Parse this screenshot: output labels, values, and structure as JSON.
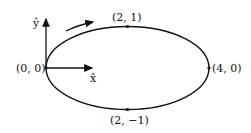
{
  "diagram": {
    "points": {
      "origin": "(0, 0)",
      "top": "(2, 1)",
      "right": "(4, 0)",
      "bottom": "(2, −1)"
    },
    "axes": {
      "x_label": "x̂",
      "y_label": "ŷ"
    },
    "direction": "clockwise"
  }
}
